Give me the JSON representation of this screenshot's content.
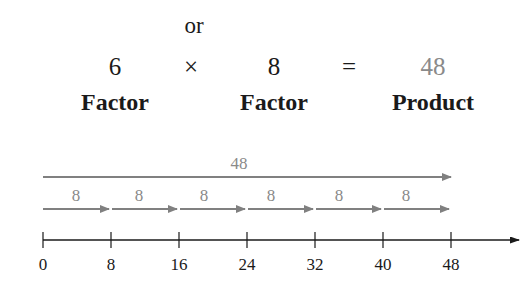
{
  "equation": {
    "or_label": "or",
    "factor1": "6",
    "times_symbol": "×",
    "factor2": "8",
    "equals_symbol": "=",
    "product": "48",
    "factor1_label": "Factor",
    "factor2_label": "Factor",
    "product_label": "Product"
  },
  "number_line": {
    "total_label": "48",
    "step_labels": [
      "8",
      "8",
      "8",
      "8",
      "8",
      "8"
    ],
    "ticks": [
      "0",
      "8",
      "16",
      "24",
      "32",
      "40",
      "48"
    ]
  },
  "colors": {
    "arrow_gray": "#808080",
    "text_dark": "#1a1a1a",
    "product_gray": "#8a8a8a"
  }
}
